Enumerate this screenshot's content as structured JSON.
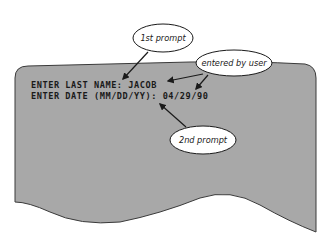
{
  "screen": {
    "background_color": "#a8a8a8",
    "border_color": "#3a3a3a",
    "lines": [
      {
        "prompt": "ENTER LAST NAME:",
        "value": "JACOB",
        "full": "ENTER LAST NAME: JACOB"
      },
      {
        "prompt": "ENTER DATE (MM/DD/YY):",
        "value": "04/29/90",
        "full": "ENTER DATE (MM/DD/YY): 04/29/90"
      }
    ]
  },
  "callouts": {
    "first_prompt": {
      "label": "1st prompt"
    },
    "entered_by_user": {
      "label": "entered by user"
    },
    "second_prompt": {
      "label": "2nd prompt"
    }
  }
}
